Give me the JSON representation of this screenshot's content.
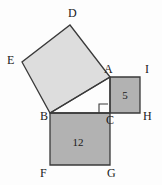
{
  "figure": {
    "background_color": "#fdfdfd",
    "stroke_color": "#3a3a3a",
    "label_color": "#1a1a1a"
  },
  "colors": {
    "hypotenuse_square_fill": "#dddddd",
    "leg_square_fill": "#b2b2b2",
    "outline": "#3a3a3a"
  },
  "points": {
    "A": {
      "label": "A",
      "x": 110,
      "y": 77
    },
    "B": {
      "label": "B",
      "x": 50,
      "y": 113
    },
    "C": {
      "label": "C",
      "x": 110,
      "y": 113
    },
    "D": {
      "label": "D",
      "x": 70,
      "y": 25
    },
    "E": {
      "label": "E",
      "x": 22,
      "y": 62
    },
    "F": {
      "label": "F",
      "x": 50,
      "y": 165
    },
    "G": {
      "label": "G",
      "x": 110,
      "y": 165
    },
    "H": {
      "label": "H",
      "x": 140,
      "y": 113
    },
    "I": {
      "label": "I",
      "x": 140,
      "y": 77
    }
  },
  "vertex_labels": [
    {
      "name": "label-D",
      "text": "D",
      "x": 68,
      "y": 17
    },
    {
      "name": "label-E",
      "text": "E",
      "x": 7,
      "y": 64
    },
    {
      "name": "label-A",
      "text": "A",
      "x": 104,
      "y": 73
    },
    {
      "name": "label-I",
      "text": "I",
      "x": 145,
      "y": 73
    },
    {
      "name": "label-B",
      "text": "B",
      "x": 40,
      "y": 120
    },
    {
      "name": "label-C",
      "text": "C",
      "x": 106,
      "y": 124
    },
    {
      "name": "label-H",
      "text": "H",
      "x": 143,
      "y": 120
    },
    {
      "name": "label-F",
      "text": "F",
      "x": 40,
      "y": 177
    },
    {
      "name": "label-G",
      "text": "G",
      "x": 107,
      "y": 177
    }
  ],
  "squares": [
    {
      "name": "square-on-hypotenuse-ABDE",
      "vertices": "A,D,E,B",
      "points": "110,77 70,25 22,62 50,113",
      "fill": "#dddddd",
      "area_label": null
    },
    {
      "name": "square-on-leg-AC",
      "vertices": "A,I,H,C",
      "points": "110,77 140,77 140,113 110,113",
      "fill": "#b2b2b2",
      "area_label": {
        "text": "5",
        "x": 125,
        "y": 99
      }
    },
    {
      "name": "square-on-leg-BC",
      "vertices": "B,C,G,F",
      "points": "50,113 110,113 110,165 50,165",
      "fill": "#b2b2b2",
      "area_label": {
        "text": "12",
        "x": 78,
        "y": 146
      }
    }
  ],
  "right_angle_mark": {
    "name": "right-angle-at-C",
    "points": "99,113 99,104 108,104",
    "vertex": "C"
  },
  "area_values": {
    "small_square": "5",
    "large_square": "12"
  }
}
